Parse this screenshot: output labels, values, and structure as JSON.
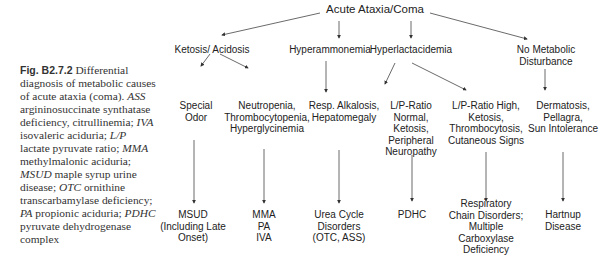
{
  "caption": {
    "fig_label": "Fig. B2.7.2",
    "title_text": "Differential diagnosis of metabolic causes of acute ataxia (coma).",
    "abbreviations": [
      {
        "abbr": "ASS",
        "def": "argininosuccinate synthatase deficiency, citrullinemia;"
      },
      {
        "abbr": "IVA",
        "def": "isovaleric aciduria;"
      },
      {
        "abbr": "L/P",
        "def": "lactate pyruvate ratio;"
      },
      {
        "abbr": "MMA",
        "def": "methylmalonic aciduria;"
      },
      {
        "abbr": "MSUD",
        "def": "maple syrup urine disease;"
      },
      {
        "abbr": "OTC",
        "def": "ornithine transcarbamylase deficiency;"
      },
      {
        "abbr": "PA",
        "def": "propionic aciduria;"
      },
      {
        "abbr": "PDHC",
        "def": "pyruvate dehydrogenase complex"
      }
    ]
  },
  "diagram": {
    "root": "Acute Ataxia/Coma",
    "level1": [
      {
        "id": "ketosis",
        "label": "Ketosis/ Acidosis"
      },
      {
        "id": "hyperammonemia",
        "label": "Hyperammonemia"
      },
      {
        "id": "hyperlactacidemia",
        "label": "Hyperlactacidemia"
      },
      {
        "id": "no-metabolic",
        "label": "No Metabolic\nDisturbance"
      }
    ],
    "level2": [
      {
        "id": "special-odor",
        "label": "Special\nOdor"
      },
      {
        "id": "neutropenia",
        "label": "Neutropenia,\nThrombocytopenia,\nHyperglycinemia"
      },
      {
        "id": "resp-alkalosis",
        "label": "Resp. Alkalosis,\nHepatomegaly"
      },
      {
        "id": "lp-normal",
        "label": "L/P-Ratio\nNormal,\nKetosis,\nPeripheral\nNeuropathy"
      },
      {
        "id": "lp-high",
        "label": "L/P-Ratio High,\nKetosis,\nThrombocytosis,\nCutaneous Signs"
      },
      {
        "id": "dermatosis",
        "label": "Dermatosis,\nPellagra,\nSun Intolerance"
      }
    ],
    "level3": [
      {
        "id": "msud",
        "label": "MSUD\n(Including Late\nOnset)"
      },
      {
        "id": "mma-pa-iva",
        "label": "MMA\nPA\nIVA"
      },
      {
        "id": "urea-cycle",
        "label": "Urea Cycle\nDisorders\n(OTC, ASS)"
      },
      {
        "id": "pdhc",
        "label": "PDHC"
      },
      {
        "id": "respiratory-chain",
        "label": "Respiratory\nChain Disorders;\nMultiple\nCarboxylase\nDeficiency"
      },
      {
        "id": "hartnup",
        "label": "Hartnup\nDisease"
      }
    ]
  }
}
